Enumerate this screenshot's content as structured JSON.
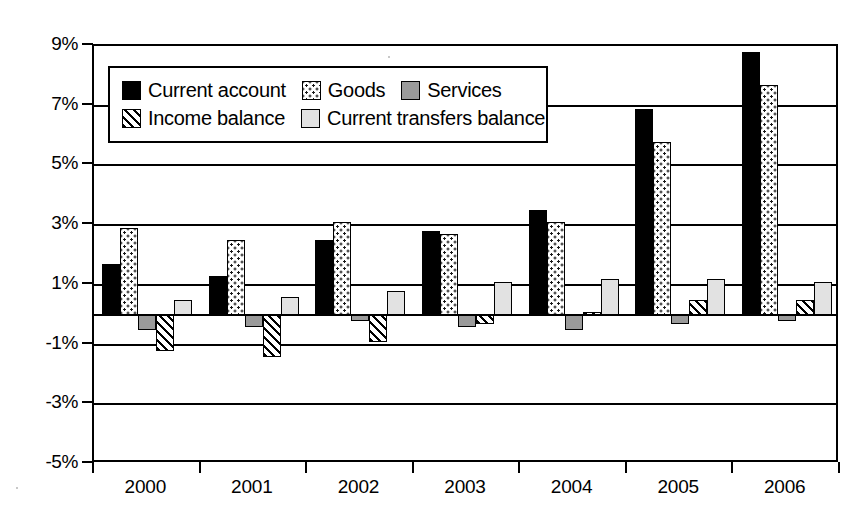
{
  "chart_data": {
    "type": "bar",
    "title": "",
    "subtitle": "",
    "xlabel": "",
    "ylabel": "",
    "categories": [
      "2000",
      "2001",
      "2002",
      "2003",
      "2004",
      "2005",
      "2006"
    ],
    "ylim": [
      -5,
      9
    ],
    "yticks": [
      9,
      7,
      5,
      3,
      1,
      -1,
      -3,
      -5
    ],
    "ytick_labels": [
      "9%",
      "7%",
      "5%",
      "3%",
      "1%",
      "-1%",
      "-3%",
      "-5%"
    ],
    "grid": true,
    "grid_axis": "y",
    "legend_position": "upper-left-inside",
    "unit": "%",
    "series": [
      {
        "name": "Current account",
        "pattern": "solid-black",
        "color": "#000000",
        "values": [
          1.7,
          1.3,
          2.5,
          2.8,
          3.5,
          6.9,
          8.8
        ]
      },
      {
        "name": "Goods",
        "pattern": "dotted",
        "color": "#ffffff",
        "values": [
          2.9,
          2.5,
          3.1,
          2.7,
          3.1,
          5.8,
          7.7
        ]
      },
      {
        "name": "Services",
        "pattern": "solid-gray",
        "color": "#9a9a9a",
        "values": [
          -0.5,
          -0.4,
          -0.2,
          -0.4,
          -0.5,
          -0.3,
          -0.2
        ]
      },
      {
        "name": "Income balance",
        "pattern": "diagonal-hatch",
        "color": "#ffffff",
        "values": [
          -1.2,
          -1.4,
          -0.9,
          -0.3,
          0.1,
          0.5,
          0.5
        ]
      },
      {
        "name": "Current transfers balance",
        "pattern": "light-gray",
        "color": "#e2e2e2",
        "values": [
          0.5,
          0.6,
          0.8,
          1.1,
          1.2,
          1.2,
          1.1
        ]
      }
    ]
  }
}
